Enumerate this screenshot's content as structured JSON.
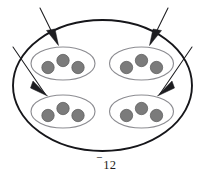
{
  "figure": {
    "name": "nested-set-diagram",
    "caption": {
      "sign": "⁻",
      "number": "12",
      "full": "⁻12"
    },
    "colors": {
      "outer_stroke": "#16161a",
      "inner_stroke": "#8d8d92",
      "dot_fill": "#7b7b7b",
      "dot_stroke": "#575757",
      "arrow": "#1d1d20",
      "background": "#ffffff"
    },
    "outer_set": {
      "label": "outer-set-boundary",
      "cx": 102.5,
      "cy": 85.5,
      "rx": 89.5,
      "ry": 65.5
    },
    "inner_sets": [
      {
        "label": "inner-set-top-left",
        "cx": 63,
        "cy": 63.5,
        "rx": 32,
        "ry": 16.5,
        "dots": [
          {
            "cx": 48,
            "cy": 67.5,
            "r": 6.2
          },
          {
            "cx": 63,
            "cy": 60.5,
            "r": 6.2
          },
          {
            "cx": 78,
            "cy": 67.5,
            "r": 6.2
          }
        ]
      },
      {
        "label": "inner-set-top-right",
        "cx": 141.5,
        "cy": 63.5,
        "rx": 32,
        "ry": 16.5,
        "dots": [
          {
            "cx": 126.5,
            "cy": 67.5,
            "r": 6.2
          },
          {
            "cx": 141.5,
            "cy": 60.5,
            "r": 6.2
          },
          {
            "cx": 156.5,
            "cy": 67.5,
            "r": 6.2
          }
        ]
      },
      {
        "label": "inner-set-bottom-left",
        "cx": 63,
        "cy": 111.5,
        "rx": 32,
        "ry": 16.5,
        "dots": [
          {
            "cx": 48,
            "cy": 115.5,
            "r": 6.2
          },
          {
            "cx": 63,
            "cy": 108.5,
            "r": 6.2
          },
          {
            "cx": 78,
            "cy": 115.5,
            "r": 6.2
          }
        ]
      },
      {
        "label": "inner-set-bottom-right",
        "cx": 141.5,
        "cy": 111.5,
        "rx": 32,
        "ry": 16.5,
        "dots": [
          {
            "cx": 126.5,
            "cy": 115.5,
            "r": 6.2
          },
          {
            "cx": 141.5,
            "cy": 108.5,
            "r": 6.2
          },
          {
            "cx": 156.5,
            "cy": 115.5,
            "r": 6.2
          }
        ]
      }
    ],
    "arrows": [
      {
        "label": "arrow-to-top-left-set",
        "x1": 40,
        "y1": 8,
        "x2": 57.5,
        "y2": 43.5,
        "head": "46.5,30.5 58.5,45.5 55.0,29.0"
      },
      {
        "label": "arrow-to-top-right-set",
        "x1": 168,
        "y1": 8,
        "x2": 150.5,
        "y2": 43.5,
        "head": "161.5,30.5 149.5,45.5 153.0,29.0"
      },
      {
        "label": "arrow-to-bottom-left-set",
        "x1": 13,
        "y1": 47,
        "x2": 45.5,
        "y2": 94.5,
        "head": "33.0,81.0 47.5,96.0 30.5,88.0"
      },
      {
        "label": "arrow-to-bottom-right-set",
        "x1": 192,
        "y1": 47,
        "x2": 159.5,
        "y2": 94.5,
        "head": "172.0,81.0 157.5,96.0 174.5,88.0"
      }
    ]
  }
}
